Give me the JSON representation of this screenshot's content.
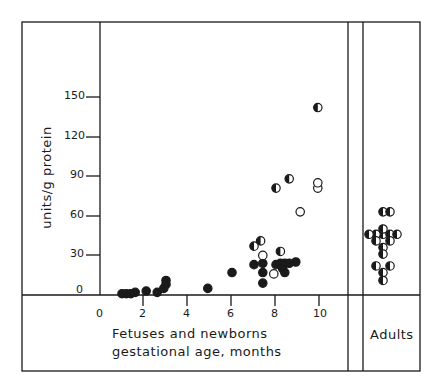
{
  "chart_data": {
    "type": "scatter",
    "title": "",
    "xlabel": "Fetuses and newborns gestational age, months",
    "ylabel": "units/g protein",
    "xlim": [
      0,
      11
    ],
    "ylim": [
      0,
      160
    ],
    "x_ticks": [
      "0",
      "2",
      "4",
      "6",
      "8",
      "10"
    ],
    "y_ticks": [
      "0",
      "30",
      "60",
      "90",
      "120",
      "150"
    ],
    "grid": false,
    "legend": null,
    "series": [
      {
        "name": "filled",
        "marker": "filled-circle",
        "points": [
          [
            1.0,
            1
          ],
          [
            1.2,
            1
          ],
          [
            1.4,
            1
          ],
          [
            1.6,
            2
          ],
          [
            2.1,
            3
          ],
          [
            2.6,
            2
          ],
          [
            2.9,
            5
          ],
          [
            3.0,
            8
          ],
          [
            3.0,
            11
          ],
          [
            4.9,
            5
          ],
          [
            6.0,
            17
          ],
          [
            7.0,
            23
          ],
          [
            7.4,
            24
          ],
          [
            7.4,
            17
          ],
          [
            7.4,
            9
          ],
          [
            8.0,
            23
          ],
          [
            8.2,
            24
          ],
          [
            8.3,
            20
          ],
          [
            8.4,
            24
          ],
          [
            8.4,
            17
          ],
          [
            8.6,
            24
          ],
          [
            8.9,
            25
          ]
        ]
      },
      {
        "name": "open",
        "marker": "open-circle",
        "points": [
          [
            7.4,
            30
          ],
          [
            7.9,
            16
          ],
          [
            9.1,
            63
          ],
          [
            9.9,
            81
          ],
          [
            9.9,
            85
          ]
        ]
      },
      {
        "name": "half",
        "marker": "half-filled-circle",
        "points": [
          [
            7.0,
            37
          ],
          [
            7.3,
            41
          ],
          [
            8.0,
            81
          ],
          [
            8.6,
            88
          ],
          [
            9.9,
            142
          ],
          [
            8.2,
            33
          ]
        ]
      }
    ],
    "adults_panel": {
      "label": "Adults",
      "points_half_filled": [
        [
          0,
          63
        ],
        [
          1,
          63
        ],
        [
          0,
          46
        ],
        [
          1,
          46
        ],
        [
          -1,
          46
        ],
        [
          2,
          46
        ],
        [
          -2,
          46
        ],
        [
          0,
          50
        ],
        [
          -1,
          41
        ],
        [
          1,
          41
        ],
        [
          0,
          36
        ],
        [
          0,
          31
        ],
        [
          -1,
          22
        ],
        [
          1,
          22
        ],
        [
          0,
          17
        ],
        [
          0,
          11
        ]
      ]
    }
  },
  "labels": {
    "y_axis": "units/g protein",
    "x_axis_line1": "Fetuses and newborns",
    "x_axis_line2": "gestational age, months",
    "adults": "Adults",
    "y150": "150",
    "y120": "120",
    "y90": "90",
    "y60": "60",
    "y30": "30",
    "y0": "0",
    "x0": "0",
    "x2": "2",
    "x4": "4",
    "x6": "6",
    "x8": "8",
    "x10": "10"
  }
}
